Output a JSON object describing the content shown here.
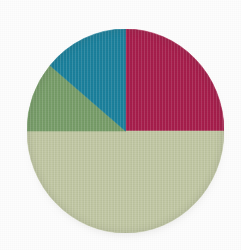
{
  "figure": {
    "kind": "pie-chart-image",
    "background_color": "#fdfdfd",
    "title": "",
    "caption": ""
  },
  "geometry": {
    "center_x": 125.5,
    "center_y": 131,
    "radius_x": 98.5,
    "radius_y": 102
  },
  "chart_data": {
    "type": "pie",
    "title": "",
    "xlabel": "",
    "ylabel": "",
    "legend_position": "none",
    "grid": false,
    "start_angle_deg": 0,
    "direction": "clockwise",
    "labels": [
      "Crimson",
      "Pale Green",
      "Medium Green",
      "Teal"
    ],
    "values": [
      25,
      50,
      11,
      14
    ],
    "percentages": [
      "25%",
      "50%",
      "11%",
      "14%"
    ],
    "colors": [
      "#ac1f4e",
      "#c6cda8",
      "#7ba26c",
      "#1c84a1"
    ],
    "slices": [
      {
        "label": "Crimson",
        "value": 25,
        "percent": "25%",
        "color": "#ac1f4e",
        "start_deg": 0,
        "end_deg": 90
      },
      {
        "label": "Pale Green",
        "value": 50,
        "percent": "50%",
        "color": "#c6cda8",
        "start_deg": 90,
        "end_deg": 270
      },
      {
        "label": "Medium Green",
        "value": 11,
        "percent": "11%",
        "color": "#7ba26c",
        "start_deg": 270,
        "end_deg": 310
      },
      {
        "label": "Teal",
        "value": 14,
        "percent": "14%",
        "color": "#1c84a1",
        "start_deg": 310,
        "end_deg": 360
      }
    ]
  }
}
